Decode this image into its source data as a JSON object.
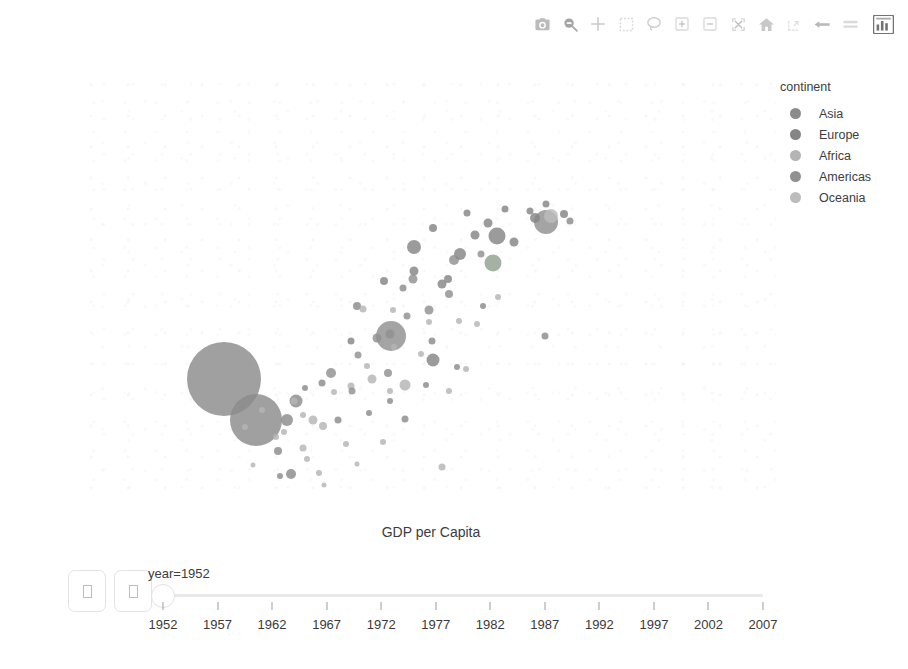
{
  "modebar": {
    "buttons": [
      {
        "name": "download-plot-icon",
        "label": "Download plot as a png"
      },
      {
        "name": "zoom-icon",
        "label": "Zoom"
      },
      {
        "name": "pan-icon",
        "label": "Pan"
      },
      {
        "name": "box-select-icon",
        "label": "Box Select"
      },
      {
        "name": "lasso-select-icon",
        "label": "Lasso Select"
      },
      {
        "name": "zoom-in-icon",
        "label": "Zoom in"
      },
      {
        "name": "zoom-out-icon",
        "label": "Zoom out"
      },
      {
        "name": "autoscale-icon",
        "label": "Autoscale"
      },
      {
        "name": "reset-axes-icon",
        "label": "Reset axes"
      },
      {
        "name": "toggle-spike-lines-icon",
        "label": "Toggle Spike Lines"
      },
      {
        "name": "hover-closest-icon",
        "label": "Show closest data on hover"
      },
      {
        "name": "hover-compare-icon",
        "label": "Compare data on hover"
      },
      {
        "name": "plotly-logo-icon",
        "label": "Produced with Plotly"
      }
    ]
  },
  "legend": {
    "title": "continent",
    "items": [
      {
        "label": "Asia",
        "color": "#8b8b8b"
      },
      {
        "label": "Europe",
        "color": "#858585"
      },
      {
        "label": "Africa",
        "color": "#b4b4b4"
      },
      {
        "label": "Americas",
        "color": "#909090"
      },
      {
        "label": "Oceania",
        "color": "#bcbcbc"
      }
    ]
  },
  "animation": {
    "play_label": "□",
    "pause_label": "□",
    "frame_label": "year=1952",
    "slider_value": 1952,
    "slider_ticks": [
      1952,
      1957,
      1962,
      1967,
      1972,
      1977,
      1982,
      1987,
      1992,
      1997,
      2002,
      2007
    ]
  },
  "chart_data": {
    "type": "scatter",
    "title": "",
    "xlabel": "GDP per Capita",
    "ylabel": "Life Expectancy",
    "xscale": "log",
    "yscale": "linear",
    "xlim": [
      100,
      100000
    ],
    "ylim": [
      25,
      92
    ],
    "grid": false,
    "legend_position": "right",
    "legend_title": "continent",
    "size_encoding": "population",
    "color_encoding": "continent",
    "animation_frame": "year",
    "current_frame": 1952,
    "xticks": [
      {
        "value": 100,
        "label": "100",
        "minor": false
      },
      {
        "value": 200,
        "label": "2",
        "minor": true
      },
      {
        "value": 500,
        "label": "5",
        "minor": true
      },
      {
        "value": 1000,
        "label": "1000",
        "minor": false
      },
      {
        "value": 2000,
        "label": "2",
        "minor": true
      },
      {
        "value": 5000,
        "label": "5",
        "minor": true
      },
      {
        "value": 10000,
        "label": "10k",
        "minor": false
      },
      {
        "value": 20000,
        "label": "2",
        "minor": true
      },
      {
        "value": 50000,
        "label": "5",
        "minor": true
      },
      {
        "value": 100000,
        "label": "100k",
        "minor": false
      }
    ],
    "yticks": [
      30,
      40,
      50,
      60,
      70,
      80,
      90
    ],
    "points": [
      {
        "x": 779,
        "y": 28.8,
        "size": 10,
        "c": "#8b8b8b"
      },
      {
        "x": 1601,
        "y": 55.2,
        "size": 7,
        "c": "#b4b4b4"
      },
      {
        "x": 2449,
        "y": 43.1,
        "size": 11,
        "c": "#b4b4b4"
      },
      {
        "x": 3521,
        "y": 30.0,
        "size": 7,
        "c": "#b4b4b4"
      },
      {
        "x": 5911,
        "y": 62.5,
        "size": 17,
        "c": "#90a090"
      },
      {
        "x": 10040,
        "y": 69.1,
        "size": 24,
        "c": "#909090"
      },
      {
        "x": 10557,
        "y": 70.0,
        "size": 14,
        "c": "#bcbcbc"
      },
      {
        "x": 6137,
        "y": 66.8,
        "size": 17,
        "c": "#858585"
      },
      {
        "x": 9867,
        "y": 50.9,
        "size": 7,
        "c": "#8b8b8b"
      },
      {
        "x": 973,
        "y": 37.5,
        "size": 9,
        "c": "#b4b4b4"
      },
      {
        "x": 803,
        "y": 40.4,
        "size": 7,
        "c": "#b4b4b4"
      },
      {
        "x": 2109,
        "y": 50.9,
        "size": 30,
        "c": "#909090"
      },
      {
        "x": 2444,
        "y": 37.6,
        "size": 7,
        "c": "#8b8b8b"
      },
      {
        "x": 3520,
        "y": 59.2,
        "size": 9,
        "c": "#858585"
      },
      {
        "x": 1062,
        "y": 43.4,
        "size": 7,
        "c": "#8b8b8b"
      },
      {
        "x": 2677,
        "y": 65.0,
        "size": 14,
        "c": "#858585"
      },
      {
        "x": 5586,
        "y": 68.8,
        "size": 9,
        "c": "#858585"
      },
      {
        "x": 400,
        "y": 44.0,
        "size": 74,
        "c": "#8b8b8b"
      },
      {
        "x": 546,
        "y": 37.4,
        "size": 52,
        "c": "#8b8b8b"
      },
      {
        "x": 749,
        "y": 37.5,
        "size": 12,
        "c": "#8b8b8b"
      },
      {
        "x": 817,
        "y": 40.4,
        "size": 13,
        "c": "#8b8b8b"
      },
      {
        "x": 684,
        "y": 32.5,
        "size": 8,
        "c": "#8b8b8b"
      },
      {
        "x": 3216,
        "y": 47.0,
        "size": 13,
        "c": "#858585"
      },
      {
        "x": 8942,
        "y": 69.6,
        "size": 10,
        "c": "#858585"
      },
      {
        "x": 7267,
        "y": 65.9,
        "size": 9,
        "c": "#858585"
      },
      {
        "x": 4931,
        "y": 66.9,
        "size": 9,
        "c": "#858585"
      },
      {
        "x": 4215,
        "y": 64.0,
        "size": 12,
        "c": "#858585"
      },
      {
        "x": 3758,
        "y": 59.9,
        "size": 8,
        "c": "#858585"
      },
      {
        "x": 1969,
        "y": 59.6,
        "size": 8,
        "c": "#858585"
      },
      {
        "x": 1418,
        "y": 50.0,
        "size": 7,
        "c": "#858585"
      },
      {
        "x": 2677,
        "y": 61.2,
        "size": 9,
        "c": "#858585"
      },
      {
        "x": 3216,
        "y": 68.0,
        "size": 8,
        "c": "#858585"
      },
      {
        "x": 4519,
        "y": 70.4,
        "size": 7,
        "c": "#858585"
      },
      {
        "x": 9980,
        "y": 71.9,
        "size": 7,
        "c": "#858585"
      },
      {
        "x": 8527,
        "y": 70.8,
        "size": 7,
        "c": "#858585"
      },
      {
        "x": 6650,
        "y": 71.1,
        "size": 7,
        "c": "#858585"
      },
      {
        "x": 490,
        "y": 36.3,
        "size": 6,
        "c": "#b4b4b4"
      },
      {
        "x": 580,
        "y": 39.0,
        "size": 6,
        "c": "#b4b4b4"
      },
      {
        "x": 670,
        "y": 34.8,
        "size": 6,
        "c": "#b4b4b4"
      },
      {
        "x": 880,
        "y": 38.2,
        "size": 6,
        "c": "#b4b4b4"
      },
      {
        "x": 1077,
        "y": 36.5,
        "size": 8,
        "c": "#b4b4b4"
      },
      {
        "x": 1200,
        "y": 41.9,
        "size": 6,
        "c": "#b4b4b4"
      },
      {
        "x": 1419,
        "y": 42.9,
        "size": 7,
        "c": "#b4b4b4"
      },
      {
        "x": 1748,
        "y": 44.0,
        "size": 9,
        "c": "#b4b4b4"
      },
      {
        "x": 2100,
        "y": 42.1,
        "size": 6,
        "c": "#b4b4b4"
      },
      {
        "x": 911,
        "y": 31.3,
        "size": 6,
        "c": "#b4b4b4"
      },
      {
        "x": 1030,
        "y": 29.0,
        "size": 6,
        "c": "#b4b4b4"
      },
      {
        "x": 1350,
        "y": 33.6,
        "size": 6,
        "c": "#b4b4b4"
      },
      {
        "x": 530,
        "y": 30.3,
        "size": 5,
        "c": "#b4b4b4"
      },
      {
        "x": 725,
        "y": 35.5,
        "size": 6,
        "c": "#b4b4b4"
      },
      {
        "x": 1660,
        "y": 46.0,
        "size": 6,
        "c": "#b4b4b4"
      },
      {
        "x": 2190,
        "y": 49.1,
        "size": 6,
        "c": "#b4b4b4"
      },
      {
        "x": 2864,
        "y": 48.0,
        "size": 6,
        "c": "#b4b4b4"
      },
      {
        "x": 3100,
        "y": 53.0,
        "size": 6,
        "c": "#b4b4b4"
      },
      {
        "x": 2170,
        "y": 55.0,
        "size": 6,
        "c": "#b4b4b4"
      },
      {
        "x": 4200,
        "y": 53.2,
        "size": 6,
        "c": "#b4b4b4"
      },
      {
        "x": 5000,
        "y": 52.7,
        "size": 6,
        "c": "#b4b4b4"
      },
      {
        "x": 6200,
        "y": 57.0,
        "size": 6,
        "c": "#b4b4b4"
      },
      {
        "x": 4500,
        "y": 45.5,
        "size": 6,
        "c": "#b4b4b4"
      },
      {
        "x": 3800,
        "y": 42.0,
        "size": 6,
        "c": "#b4b4b4"
      },
      {
        "x": 1160,
        "y": 45.0,
        "size": 10,
        "c": "#909090"
      },
      {
        "x": 1530,
        "y": 47.8,
        "size": 7,
        "c": "#909090"
      },
      {
        "x": 1840,
        "y": 50.5,
        "size": 9,
        "c": "#909090"
      },
      {
        "x": 2100,
        "y": 51.1,
        "size": 9,
        "c": "#909090"
      },
      {
        "x": 2480,
        "y": 54.0,
        "size": 7,
        "c": "#909090"
      },
      {
        "x": 3100,
        "y": 55.0,
        "size": 9,
        "c": "#909090"
      },
      {
        "x": 3800,
        "y": 57.5,
        "size": 8,
        "c": "#909090"
      },
      {
        "x": 2050,
        "y": 45.0,
        "size": 8,
        "c": "#909090"
      },
      {
        "x": 1430,
        "y": 42.0,
        "size": 7,
        "c": "#909090"
      },
      {
        "x": 2650,
        "y": 60.0,
        "size": 9,
        "c": "#909090"
      },
      {
        "x": 4000,
        "y": 63.0,
        "size": 10,
        "c": "#909090"
      },
      {
        "x": 5200,
        "y": 64.0,
        "size": 7,
        "c": "#909090"
      },
      {
        "x": 1700,
        "y": 38.5,
        "size": 6,
        "c": "#8b8b8b"
      },
      {
        "x": 2100,
        "y": 40.4,
        "size": 6,
        "c": "#8b8b8b"
      },
      {
        "x": 900,
        "y": 42.5,
        "size": 6,
        "c": "#8b8b8b"
      },
      {
        "x": 1250,
        "y": 37.4,
        "size": 7,
        "c": "#8b8b8b"
      },
      {
        "x": 3180,
        "y": 50.0,
        "size": 7,
        "c": "#8b8b8b"
      },
      {
        "x": 4100,
        "y": 45.9,
        "size": 6,
        "c": "#8b8b8b"
      },
      {
        "x": 1500,
        "y": 55.6,
        "size": 8,
        "c": "#8b8b8b"
      },
      {
        "x": 2400,
        "y": 58.5,
        "size": 7,
        "c": "#8b8b8b"
      },
      {
        "x": 5300,
        "y": 55.7,
        "size": 6,
        "c": "#8b8b8b"
      },
      {
        "x": 3000,
        "y": 43.0,
        "size": 6,
        "c": "#8b8b8b"
      },
      {
        "x": 700,
        "y": 28.5,
        "size": 6,
        "c": "#8b8b8b"
      },
      {
        "x": 12000,
        "y": 70.3,
        "size": 8,
        "c": "#858585"
      },
      {
        "x": 12700,
        "y": 69.2,
        "size": 7,
        "c": "#8b8b8b"
      },
      {
        "x": 880,
        "y": 33.0,
        "size": 7,
        "c": "#b4b4b4"
      },
      {
        "x": 1950,
        "y": 34.0,
        "size": 6,
        "c": "#b4b4b4"
      },
      {
        "x": 1080,
        "y": 27.0,
        "size": 5,
        "c": "#b4b4b4"
      },
      {
        "x": 1500,
        "y": 30.5,
        "size": 5,
        "c": "#b4b4b4"
      }
    ]
  }
}
